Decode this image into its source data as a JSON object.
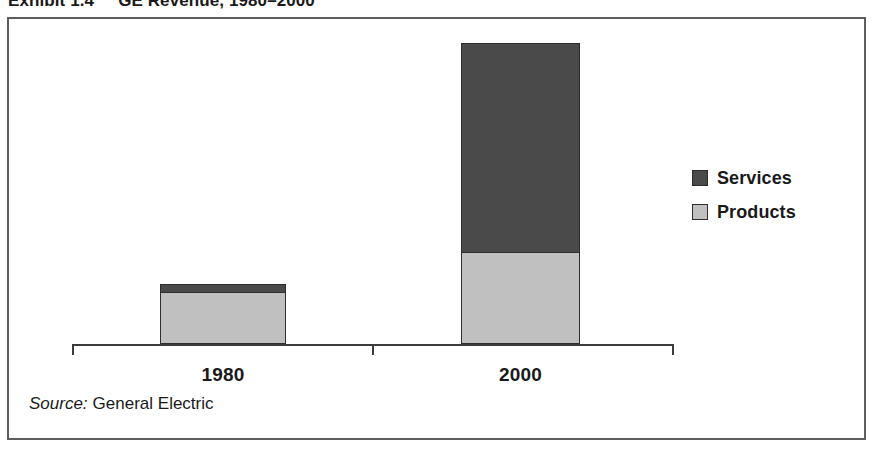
{
  "exhibit": {
    "number": "Exhibit 1.4",
    "title": "GE Revenue, 1980–2000"
  },
  "source": {
    "lead": "Source:",
    "text": "General Electric"
  },
  "legend": {
    "position": "right",
    "items": [
      {
        "label": "Services",
        "color": "#4a4a4a",
        "swatch_name": "legend-swatch-services"
      },
      {
        "label": "Products",
        "color": "#c0c0c0",
        "swatch_name": "legend-swatch-products"
      }
    ]
  },
  "axis": {
    "ticks": [
      "left",
      "middle",
      "right"
    ],
    "categories": [
      "1980",
      "2000"
    ]
  },
  "chart_data": {
    "type": "bar",
    "subtype": "stacked-vertical",
    "title": "GE Revenue, 1980–2000",
    "subtitle": "Exhibit 1.4",
    "xlabel": "",
    "ylabel": "",
    "categories": [
      "1980",
      "2000"
    ],
    "series": [
      {
        "name": "Products",
        "color": "#c0c0c0",
        "values": [
          52,
          92
        ],
        "unit": "relative bar height (px)"
      },
      {
        "name": "Services",
        "color": "#4a4a4a",
        "values": [
          8,
          209
        ],
        "unit": "relative bar height (px)"
      }
    ],
    "totals": [
      60,
      301
    ],
    "stack_order": [
      "Products",
      "Services"
    ],
    "ylim": [
      0,
      310
    ],
    "grid": false,
    "axis_labels_shown": false,
    "legend": [
      "Services",
      "Products"
    ],
    "legend_position": "right",
    "annotations": [],
    "source": "General Electric"
  },
  "render": {
    "bars": [
      {
        "name": "bar-1980",
        "category": "1980",
        "segments": [
          {
            "series": "Services",
            "height_px": 8,
            "color": "#4a4a4a"
          },
          {
            "series": "Products",
            "height_px": 52,
            "color": "#c0c0c0"
          }
        ]
      },
      {
        "name": "bar-2000",
        "category": "2000",
        "segments": [
          {
            "series": "Services",
            "height_px": 209,
            "color": "#4a4a4a"
          },
          {
            "series": "Products",
            "height_px": 92,
            "color": "#c0c0c0"
          }
        ]
      }
    ]
  }
}
